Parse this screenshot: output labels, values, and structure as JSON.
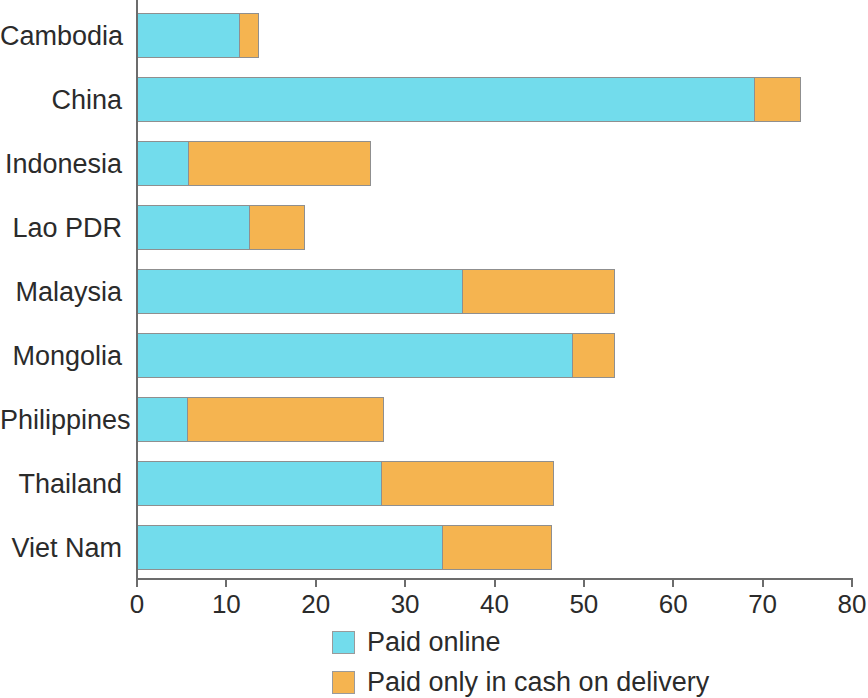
{
  "chart_data": {
    "type": "bar",
    "orientation": "horizontal",
    "stacked": true,
    "title": "",
    "subtitle": "",
    "xlabel": "",
    "ylabel": "",
    "xlim": [
      0,
      80
    ],
    "xticks": [
      0,
      10,
      20,
      30,
      40,
      50,
      60,
      70,
      80
    ],
    "xtick_labels": [
      "0",
      "10",
      "20",
      "30",
      "40",
      "50",
      "60",
      "70",
      "80"
    ],
    "grid": false,
    "legend_position": "bottom",
    "categories": [
      "Cambodia",
      "China",
      "Indonesia",
      "Lao PDR",
      "Malaysia",
      "Mongolia",
      "Philippines",
      "Thailand",
      "Viet Nam"
    ],
    "series": [
      {
        "name": "Paid online",
        "color": "#72DCEC",
        "values": [
          11.5,
          69.1,
          5.8,
          12.6,
          36.5,
          48.8,
          5.7,
          27.4,
          34.2
        ]
      },
      {
        "name": "Paid only in cash on delivery",
        "color": "#F5B450",
        "values": [
          2.3,
          5.3,
          20.5,
          6.3,
          17.1,
          4.8,
          22.0,
          19.4,
          12.4
        ]
      }
    ],
    "totals": [
      13.8,
      74.4,
      26.3,
      18.9,
      53.6,
      53.6,
      27.7,
      46.8,
      46.6
    ]
  },
  "legend": {
    "items": [
      {
        "label": "Paid online",
        "color": "#72DCEC"
      },
      {
        "label": "Paid only in cash on delivery",
        "color": "#F5B450"
      }
    ]
  },
  "colors": {
    "series_online": "#72DCEC",
    "series_cash": "#F5B450",
    "axis": "#6C6C6C",
    "text": "#2B2B2B",
    "bar_outline": "#8F8F8F",
    "background": "#FFFFFF"
  }
}
